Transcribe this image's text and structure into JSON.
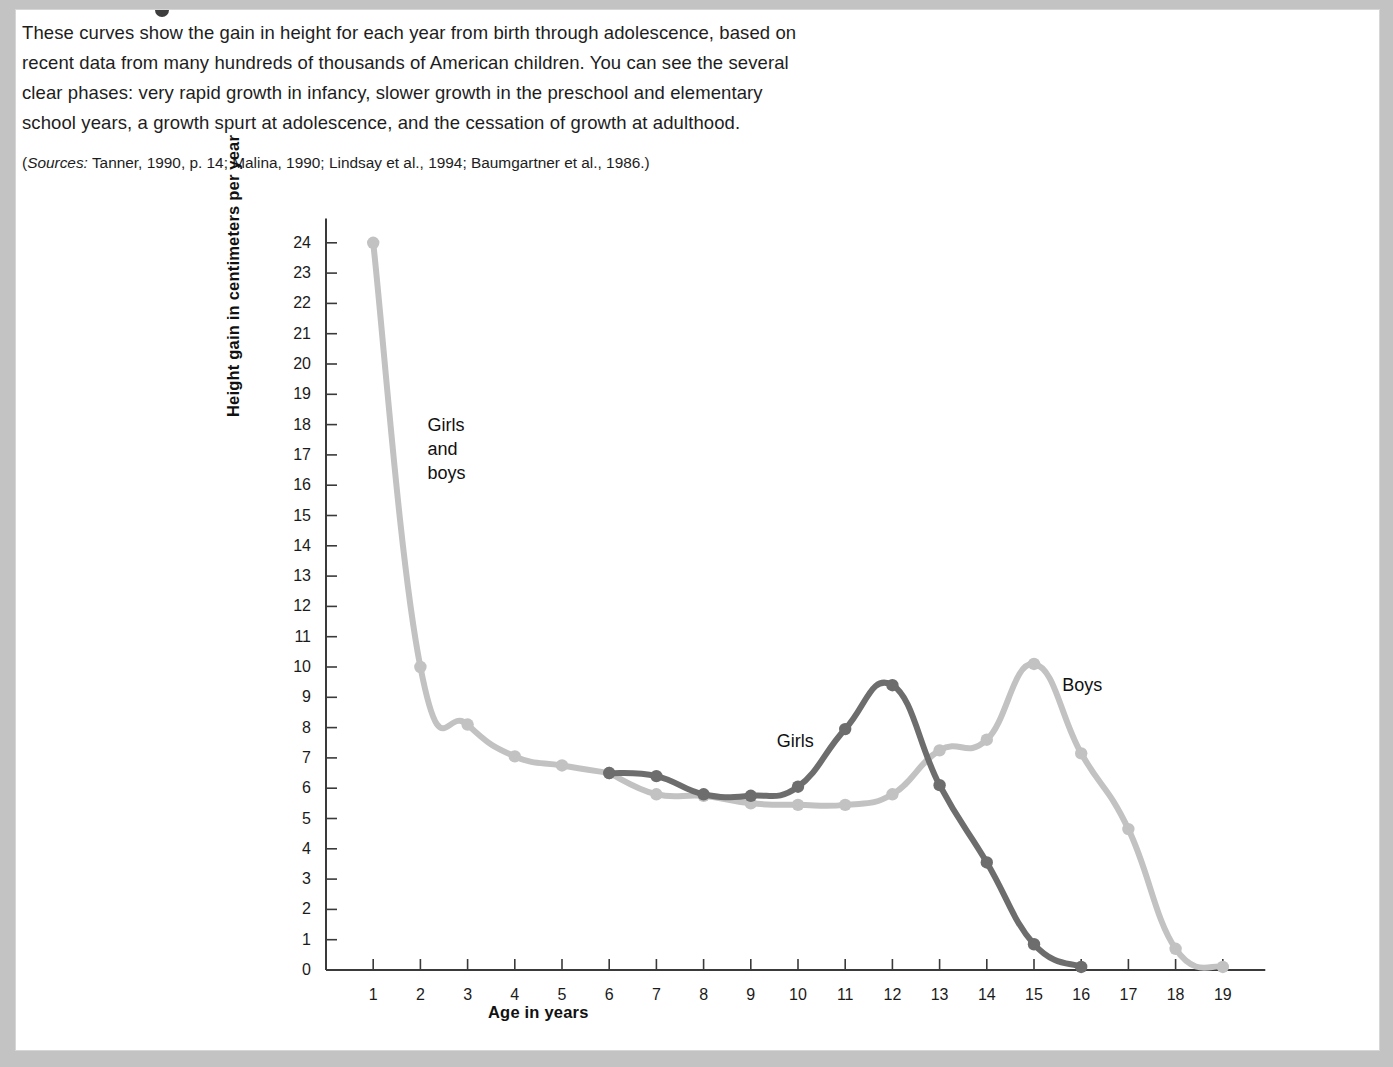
{
  "caption": {
    "lines": [
      "These curves show the gain in height for each year from birth through adolescence, based on",
      "recent data from many hundreds of thousands of American children. You can see the several",
      "clear phases: very rapid growth in infancy, slower growth in the preschool and elementary",
      "school years, a growth spurt at adolescence, and the cessation of growth at adulthood."
    ],
    "sources_prefix": "Sources:",
    "sources_text": " Tanner, 1990, p. 14; Malina, 1990; Lindsay et al., 1994; Baumgartner et al., 1986.)",
    "sources_open_paren": "("
  },
  "colors": {
    "girls_line": "#6d6d6d",
    "boys_line": "#c2c2c2",
    "axis": "#3a3a3a",
    "text": "#1b1b1b",
    "page_background": "#ffffff",
    "frame": "#c3c3c3"
  },
  "chart_data": {
    "type": "line",
    "title": "",
    "xlabel": "Age in years",
    "ylabel": "Height gain in centimeters per year",
    "xlim": [
      0,
      20
    ],
    "ylim": [
      0,
      24.8
    ],
    "xticks": [
      1,
      2,
      3,
      4,
      5,
      6,
      7,
      8,
      9,
      10,
      11,
      12,
      13,
      14,
      15,
      16,
      17,
      18,
      19
    ],
    "yticks": [
      0,
      1,
      2,
      3,
      4,
      5,
      6,
      7,
      8,
      9,
      10,
      11,
      12,
      13,
      14,
      15,
      16,
      17,
      18,
      19,
      20,
      21,
      22,
      23,
      24
    ],
    "grid": false,
    "legend_position": "inline-annotations",
    "annotations": [
      {
        "text": "Girls\nand\nboys",
        "x": 2.15,
        "y": 18.0,
        "name": "girls-and-boys-label"
      },
      {
        "text": "Girls",
        "x": 9.55,
        "y": 7.55,
        "name": "girls-label"
      },
      {
        "text": "Boys",
        "x": 15.6,
        "y": 9.4,
        "name": "boys-label"
      }
    ],
    "series": [
      {
        "name": "Girls and boys",
        "color": "#c2c2c2",
        "x": [
          1,
          2,
          3,
          4,
          5,
          6
        ],
        "values": [
          24.0,
          10.0,
          8.1,
          7.05,
          6.75,
          6.5
        ]
      },
      {
        "name": "Girls",
        "color": "#6d6d6d",
        "x": [
          6,
          7,
          8,
          9,
          10,
          11,
          12,
          13,
          14,
          15,
          16
        ],
        "values": [
          6.5,
          6.4,
          5.8,
          5.75,
          6.05,
          7.95,
          9.4,
          6.1,
          3.55,
          0.85,
          0.1
        ]
      },
      {
        "name": "Boys",
        "color": "#c2c2c2",
        "x": [
          6,
          7,
          8,
          9,
          10,
          11,
          12,
          13,
          14,
          15,
          16,
          17,
          18,
          19
        ],
        "values": [
          6.5,
          5.8,
          5.75,
          5.5,
          5.45,
          5.45,
          5.8,
          7.25,
          7.6,
          10.1,
          7.15,
          4.65,
          0.7,
          0.1
        ]
      }
    ]
  }
}
